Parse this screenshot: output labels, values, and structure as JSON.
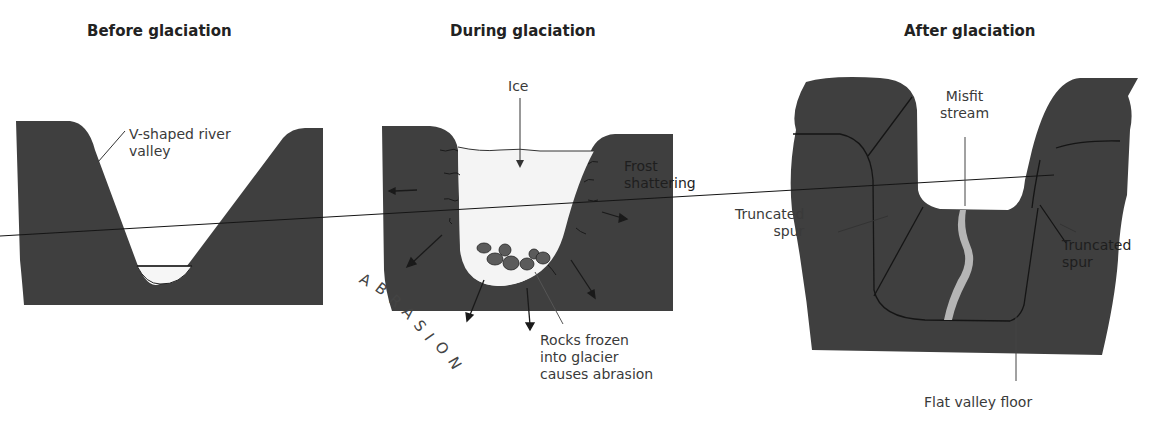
{
  "panels": [
    {
      "title": "Before glaciation",
      "labels": {
        "valley": [
          "V-shaped river",
          "valley"
        ]
      }
    },
    {
      "title": "During glaciation",
      "labels": {
        "ice": "Ice",
        "frost": [
          "Frost",
          "shattering"
        ],
        "abrasion_arc": [
          "A",
          "B",
          "R",
          "A",
          "S",
          "I",
          "O",
          "N"
        ],
        "rocks": [
          "Rocks frozen",
          "into glacier",
          "causes abrasion"
        ]
      }
    },
    {
      "title": "After glaciation",
      "labels": {
        "misfit": [
          "Misfit",
          "stream"
        ],
        "spur_left": [
          "Truncated",
          "spur"
        ],
        "spur_right": [
          "Truncated",
          "spur"
        ],
        "floor": "Flat valley floor"
      }
    }
  ],
  "colors": {
    "rock": "#3f3f3f",
    "ice": "#f4f4f4",
    "rocks_in_ice": "#5a5a5a",
    "stream": "#b5b5b5",
    "line": "#1a1a1a"
  }
}
